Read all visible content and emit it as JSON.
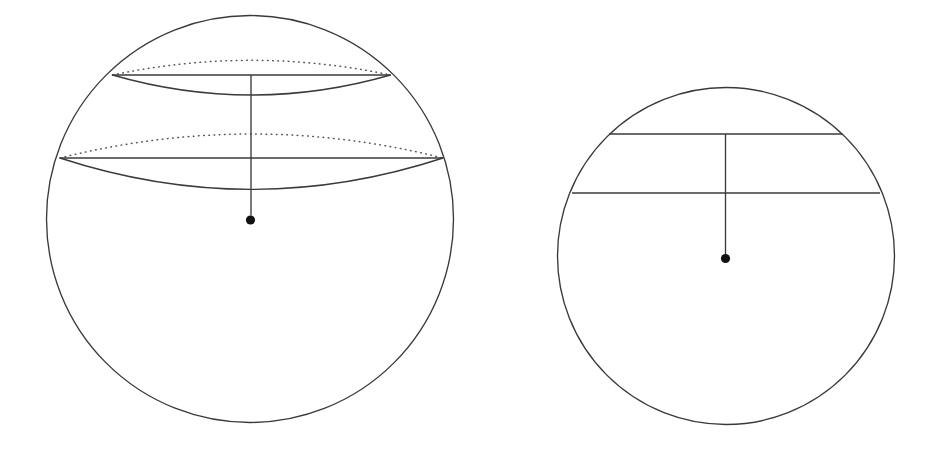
{
  "canvas": {
    "width": 937,
    "height": 456,
    "background": "#ffffff",
    "stroke_color": "#3a3a3a",
    "dotted_color": "#555555",
    "dot_color": "#111111"
  },
  "figures": [
    {
      "id": "sphere-figure",
      "name": "sphere-with-two-spherical-caps",
      "outline": {
        "name": "sphere-outline-circle",
        "cx": 250,
        "cy": 219,
        "r": 203.5
      },
      "center_point": {
        "name": "sphere-center-dot",
        "cx": 250.5,
        "cy": 220.0,
        "r": 4.6
      },
      "vertical_axis": {
        "name": "sphere-vertical-axis",
        "x": 251,
        "y_top": 75,
        "y_bottom": 215.5
      },
      "latitude_circles": [
        {
          "name": "upper-latitude-circle",
          "cx": 251.5,
          "cy": 75.0,
          "rx": 139.0,
          "ry": 30.0,
          "chord_y": 75.0,
          "chord_x1": 112.5,
          "chord_x2": 390.5,
          "front_arc_depth": 30.0,
          "back_arc_depth": 22.0,
          "front_style": "solid",
          "back_style": "dotted"
        },
        {
          "name": "lower-latitude-circle",
          "cx": 251.5,
          "cy": 158.0,
          "rx": 191.5,
          "ry": 47.0,
          "chord_y": 158.0,
          "chord_x1": 60.0,
          "chord_x2": 443.0,
          "front_arc_depth": 47.0,
          "back_arc_depth": 36.0,
          "front_style": "solid",
          "back_style": "dotted"
        }
      ]
    },
    {
      "id": "disk-figure",
      "name": "disk-with-two-chords",
      "outline": {
        "name": "disk-outline-circle",
        "cx": 726,
        "cy": 256,
        "r": 168.5
      },
      "center_point": {
        "name": "disk-center-dot",
        "cx": 725.5,
        "cy": 258.5,
        "r": 4.6
      },
      "vertical_axis": {
        "name": "disk-vertical-axis",
        "x": 725.5,
        "y_top": 134.0,
        "y_bottom": 254.0
      },
      "chords": [
        {
          "name": "upper-chord",
          "y": 134.0,
          "x1": 609.0,
          "x2": 842.5
        },
        {
          "name": "lower-chord",
          "y": 193.0,
          "x1": 572.0,
          "x2": 880.0
        }
      ]
    }
  ],
  "chart_data": {
    "type": "diagram",
    "title": "",
    "panels": [
      {
        "label": "sphere",
        "shape": "circle",
        "center": [
          250,
          219
        ],
        "radius": 203.5,
        "marked_center": true,
        "cuts": [
          {
            "label": "upper latitude",
            "chord_y": 75,
            "half_width": 139,
            "ellipse_semi_minor": 30
          },
          {
            "label": "lower latitude",
            "chord_y": 158,
            "half_width": 191.5,
            "ellipse_semi_minor": 47
          }
        ],
        "radius_segment": {
          "from": [
            251,
            75
          ],
          "to": [
            251,
            220
          ]
        }
      },
      {
        "label": "disk",
        "shape": "circle",
        "center": [
          726,
          256
        ],
        "radius": 168.5,
        "marked_center": true,
        "cuts": [
          {
            "label": "upper chord",
            "y": 134,
            "half_width": 117
          },
          {
            "label": "lower chord",
            "y": 193,
            "half_width": 154
          }
        ],
        "radius_segment": {
          "from": [
            725.5,
            134
          ],
          "to": [
            725.5,
            258.5
          ]
        }
      }
    ],
    "xlabel": "",
    "ylabel": "",
    "legend": []
  }
}
